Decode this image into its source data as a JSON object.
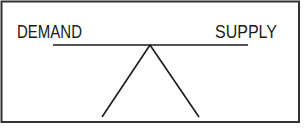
{
  "diagram": {
    "left_label": "DEMAND",
    "right_label": "SUPPLY",
    "balance_state": "level"
  },
  "colors": {
    "stroke": "#1a1a1a",
    "background": "#ffffff"
  }
}
